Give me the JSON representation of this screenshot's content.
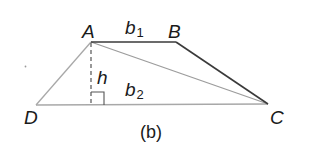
{
  "figure": {
    "caption": "(b)",
    "shape": "trapezoid",
    "vertices": {
      "A": {
        "label": "A",
        "x": 91,
        "y": 42
      },
      "B": {
        "label": "B",
        "x": 176,
        "y": 42
      },
      "C": {
        "label": "C",
        "x": 268,
        "y": 104
      },
      "D": {
        "label": "D",
        "x": 36,
        "y": 105
      }
    },
    "height_foot": {
      "x": 91,
      "y": 105
    },
    "labels": {
      "b1_base": "b",
      "b1_sub": "1",
      "b2_base": "b",
      "b2_sub": "2",
      "h": "h"
    },
    "colors": {
      "dark_line": "#3a3a3a",
      "light_line": "#a8a8a8",
      "text": "#1a1a1a",
      "stray_dot": "#9a9a9a"
    },
    "segments": [
      {
        "name": "AB",
        "from": "A",
        "to": "B",
        "style": "dark"
      },
      {
        "name": "BC",
        "from": "B",
        "to": "C",
        "style": "dark"
      },
      {
        "name": "DC",
        "from": "D",
        "to": "C",
        "style": "light"
      },
      {
        "name": "AD",
        "from": "A",
        "to": "D",
        "style": "light"
      },
      {
        "name": "AC",
        "from": "A",
        "to": "C",
        "style": "light-diagonal"
      },
      {
        "name": "height",
        "from": "A",
        "to": "foot",
        "style": "dashed"
      }
    ]
  }
}
